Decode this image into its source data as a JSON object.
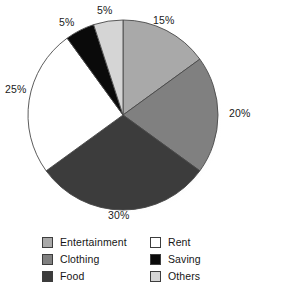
{
  "chart_data": {
    "type": "pie",
    "title": "",
    "subtitle": "",
    "xlabel": "",
    "ylabel": "",
    "legend_position": "bottom",
    "grid": false,
    "start_angle_deg": 0,
    "direction": "clockwise",
    "categories": [
      "Entertainment",
      "Clothing",
      "Food",
      "Rent",
      "Saving",
      "Others"
    ],
    "values": [
      15,
      20,
      30,
      25,
      5,
      5
    ],
    "value_labels": [
      "15%",
      "20%",
      "30%",
      "25%",
      "5%",
      "5%"
    ],
    "colors": [
      "#a9a9a9",
      "#808080",
      "#3c3c3c",
      "#ffffff",
      "#0a0a0a",
      "#d5d5d5"
    ],
    "slice_outline_color": "#4a4a4a",
    "slices": [
      {
        "label": "Entertainment",
        "value": 15,
        "value_label": "15%",
        "color": "#a9a9a9"
      },
      {
        "label": "Clothing",
        "value": 20,
        "value_label": "20%",
        "color": "#808080"
      },
      {
        "label": "Food",
        "value": 30,
        "value_label": "30%",
        "color": "#3c3c3c"
      },
      {
        "label": "Rent",
        "value": 25,
        "value_label": "25%",
        "color": "#ffffff"
      },
      {
        "label": "Saving",
        "value": 5,
        "value_label": "5%",
        "color": "#0a0a0a"
      },
      {
        "label": "Others",
        "value": 5,
        "value_label": "5%",
        "color": "#d5d5d5"
      }
    ]
  },
  "legend": {
    "column_left": [
      {
        "label": "Entertainment",
        "color": "#a9a9a9"
      },
      {
        "label": "Clothing",
        "color": "#808080"
      },
      {
        "label": "Food",
        "color": "#3c3c3c"
      }
    ],
    "column_right": [
      {
        "label": "Rent",
        "color": "#ffffff"
      },
      {
        "label": "Saving",
        "color": "#0a0a0a"
      },
      {
        "label": "Others",
        "color": "#d5d5d5"
      }
    ]
  }
}
